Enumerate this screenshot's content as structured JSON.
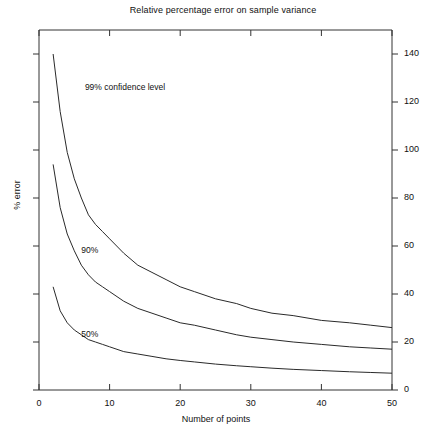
{
  "chart_data": {
    "type": "line",
    "title": "Relative percentage error on sample variance",
    "xlabel": "Number of points",
    "ylabel": "% error",
    "xlim": [
      0,
      50
    ],
    "ylim": [
      0,
      150
    ],
    "grid": false,
    "legend_position": "inline-annotations",
    "xticks": [
      0,
      10,
      20,
      30,
      40,
      50
    ],
    "xtick_labels": [
      "0",
      "10",
      "20",
      "30",
      "40",
      "50"
    ],
    "yticks": [
      0,
      20,
      40,
      60,
      80,
      100,
      120,
      140
    ],
    "ytick_labels": [
      "0",
      "20",
      "40",
      "60",
      "80",
      "100",
      "120",
      "140"
    ],
    "yaxis_side": "right",
    "left_axis_ticks_unlabeled": true,
    "annotations": [
      {
        "text": "99%  confidence level",
        "x": 6.5,
        "y": 126
      },
      {
        "text": "90%",
        "x": 6.0,
        "y": 58
      },
      {
        "text": "50%",
        "x": 6.0,
        "y": 23
      }
    ],
    "series": [
      {
        "name": "99%  confidence level",
        "x": [
          2,
          3,
          4,
          5,
          6,
          7,
          8,
          9,
          10,
          12,
          14,
          16,
          18,
          20,
          22,
          25,
          28,
          30,
          33,
          36,
          40,
          44,
          47,
          50
        ],
        "values": [
          140,
          116,
          99,
          88,
          80,
          73,
          69,
          66,
          63,
          57,
          52,
          49,
          46,
          43,
          41,
          38,
          36,
          34,
          32,
          31,
          29,
          28,
          27,
          26
        ]
      },
      {
        "name": "90%",
        "x": [
          2,
          3,
          4,
          5,
          6,
          7,
          8,
          9,
          10,
          12,
          14,
          16,
          18,
          20,
          22,
          25,
          28,
          30,
          33,
          36,
          40,
          44,
          47,
          50
        ],
        "values": [
          94,
          76,
          65,
          58,
          52,
          48,
          45,
          43,
          41,
          37,
          34,
          32,
          30,
          28,
          27,
          25,
          23,
          22,
          21,
          20,
          19,
          18,
          17.5,
          17
        ]
      },
      {
        "name": "50%",
        "x": [
          2,
          3,
          4,
          5,
          6,
          7,
          8,
          9,
          10,
          12,
          14,
          16,
          18,
          20,
          22,
          25,
          28,
          30,
          33,
          36,
          40,
          44,
          47,
          50
        ],
        "values": [
          43,
          33,
          28,
          25,
          23,
          21,
          20,
          19,
          18,
          16,
          15,
          14,
          13,
          12.3,
          11.7,
          10.8,
          10.1,
          9.7,
          9.1,
          8.6,
          8.1,
          7.6,
          7.3,
          7
        ]
      }
    ]
  },
  "axis": {
    "tick_color": "#111111",
    "line_color": "#333333"
  }
}
